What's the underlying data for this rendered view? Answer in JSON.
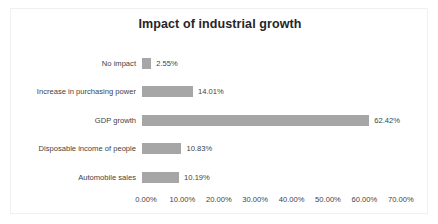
{
  "chart_data": {
    "type": "bar",
    "orientation": "horizontal",
    "title": "Impact of industrial growth",
    "xlabel": "",
    "ylabel": "",
    "categories": [
      "No impact",
      "Increase in purchasing power",
      "GDP growth",
      "Disposable income of people",
      "Automobile sales"
    ],
    "values": [
      2.55,
      14.01,
      62.42,
      10.83,
      10.19
    ],
    "value_labels": [
      "2.55%",
      "14.01%",
      "62.42%",
      "10.83%",
      "10.19%"
    ],
    "xlim": [
      0,
      70
    ],
    "xticks": [
      0,
      10,
      20,
      30,
      40,
      50,
      60,
      70
    ],
    "xtick_labels": [
      "0.00%",
      "10.00%",
      "20.00%",
      "30.00%",
      "40.00%",
      "50.00%",
      "60.00%",
      "70.00%"
    ],
    "grid": false,
    "legend": "none",
    "bar_color": "#a6a6a6",
    "text_color": "#3f3f3f",
    "background_color": "#ffffff",
    "border_color": "#f0f0f0"
  }
}
